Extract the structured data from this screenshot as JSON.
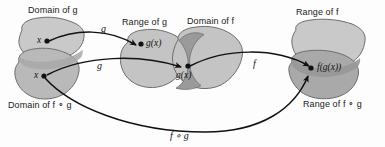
{
  "figure": {
    "type": "diagram"
  },
  "colors": {
    "blob_light": "#c9c9c9",
    "blob_medium": "#b9b9b9",
    "blob_dark": "#a8a8a8",
    "blob_darkest": "#9a9a9a",
    "outline": "#6e6e6e",
    "arrow": "#111111",
    "text": "#1a1a1a",
    "background": "#fdfdfd"
  },
  "set_labels": {
    "domain_of_g": "Domain of g",
    "range_of_g": "Range of g",
    "domain_of_f": "Domain of f",
    "range_of_f": "Range of f",
    "domain_of_fog": "Domain of f ∘ g",
    "range_of_fog": "Range of f ∘ g"
  },
  "point_labels": {
    "x_top": "x",
    "x_bottom": "x",
    "gx_top": "g(x)",
    "gx_middle": "g(x)",
    "fgx": "f(g(x))"
  },
  "arrow_labels": {
    "g_upper": "g",
    "g_lower": "g",
    "f": "f",
    "fog": "f ∘ g"
  }
}
